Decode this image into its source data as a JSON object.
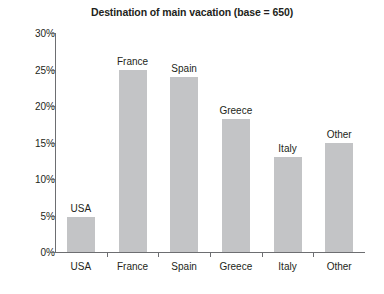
{
  "chart_data": {
    "type": "bar",
    "title": "Destination of main vacation (base = 650)",
    "xlabel": "",
    "ylabel": "",
    "categories": [
      "USA",
      "France",
      "Spain",
      "Greece",
      "Italy",
      "Other"
    ],
    "values": [
      4.8,
      24.9,
      24.0,
      18.2,
      13.0,
      15.0
    ],
    "point_labels": [
      "USA",
      "France",
      "Spain",
      "Greece",
      "Italy",
      "Other"
    ],
    "ylim": [
      0,
      30
    ],
    "ytick_labels": [
      "0%",
      "5%",
      "10%",
      "15%",
      "20%",
      "25%",
      "30%"
    ],
    "ytick_values": [
      0,
      5,
      10,
      15,
      20,
      25,
      30
    ],
    "grid": false,
    "legend": null,
    "bar_color": "#c3c4c6",
    "axis_color": "#6d6e71",
    "text_color": "#231f20",
    "background": "#ffffff"
  }
}
